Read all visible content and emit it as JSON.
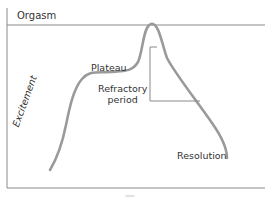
{
  "diagram": {
    "type": "sexual-response-cycle",
    "labels": {
      "orgasm": "Orgasm",
      "plateau": "Plateau",
      "excitement": "Excitement",
      "refractory_line1": "Refractory",
      "refractory_line2": "period",
      "resolution": "Resolution"
    },
    "phases": [
      "Excitement",
      "Plateau",
      "Orgasm",
      "Refractory period",
      "Resolution"
    ],
    "colors": {
      "curve": "#9a9a9a",
      "axis": "#8a8a8a",
      "text": "#333333",
      "bracket": "#8a8a8a",
      "background": "#ffffff"
    }
  }
}
